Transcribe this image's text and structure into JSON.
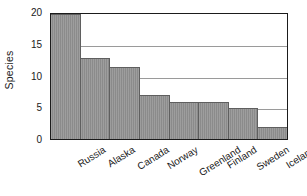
{
  "chart_data": {
    "type": "bar",
    "title": "",
    "xlabel": "",
    "ylabel": "Species",
    "categories": [
      "Russia",
      "Alaska",
      "Canada",
      "Norway",
      "Greenland",
      "Finland",
      "Sweden",
      "Iceland"
    ],
    "values": [
      20,
      13,
      11.5,
      7,
      6,
      6,
      5,
      2
    ],
    "ylim": [
      0,
      20
    ],
    "yticks": [
      0,
      5,
      10,
      15,
      20
    ],
    "ytick_labels": [
      "0",
      "5",
      "10",
      "15",
      "20"
    ],
    "grid": "horizontal",
    "legend": "none",
    "bar_color": "#8b8b8b",
    "axis_color": "#1b1b1b",
    "gridline_color": "#9a9a9a"
  }
}
